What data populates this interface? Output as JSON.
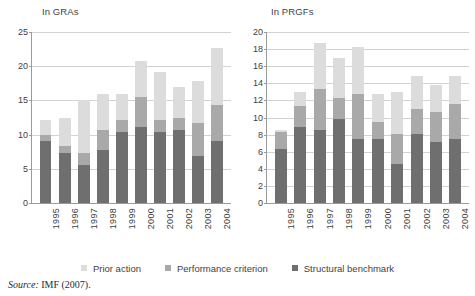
{
  "figure": {
    "source_label": "Source:",
    "source_text": "IMF (2007)."
  },
  "legend": {
    "items": [
      {
        "label": "Prior action",
        "color": "#dcdcdc",
        "key": "prior_action"
      },
      {
        "label": "Performance criterion",
        "color": "#a9a9a9",
        "key": "performance_criterion"
      },
      {
        "label": "Structural benchmark",
        "color": "#6f6f6f",
        "key": "structural_benchmark"
      }
    ]
  },
  "chart_data": [
    {
      "type": "bar",
      "id": "gra",
      "title": "In GRAs",
      "stacked": true,
      "xlabel": "",
      "ylabel": "",
      "ylim": [
        0,
        25
      ],
      "yticks": [
        0,
        5,
        10,
        15,
        20,
        25
      ],
      "grid": true,
      "legend_position": "bottom",
      "categories": [
        "1995",
        "1996",
        "1997",
        "1998",
        "1999",
        "2000",
        "2001",
        "2002",
        "2003",
        "2004"
      ],
      "series": [
        {
          "name": "Structural benchmark",
          "color": "#6f6f6f",
          "values": [
            9.1,
            7.3,
            5.6,
            7.8,
            10.4,
            11.1,
            10.4,
            10.7,
            6.9,
            9.1
          ]
        },
        {
          "name": "Performance criterion",
          "color": "#a9a9a9",
          "values": [
            0.8,
            1.0,
            1.7,
            2.9,
            1.7,
            4.4,
            1.7,
            1.8,
            4.8,
            5.2
          ]
        },
        {
          "name": "Prior action",
          "color": "#dcdcdc",
          "values": [
            2.2,
            4.2,
            7.8,
            5.3,
            3.9,
            5.3,
            7.1,
            4.4,
            6.1,
            8.3
          ]
        }
      ],
      "totals": [
        12.1,
        12.5,
        15.1,
        16.0,
        16.0,
        20.8,
        19.2,
        16.9,
        17.8,
        22.6
      ]
    },
    {
      "type": "bar",
      "id": "prgf",
      "title": "In PRGFs",
      "stacked": true,
      "xlabel": "",
      "ylabel": "",
      "ylim": [
        0,
        20
      ],
      "yticks": [
        0,
        2,
        4,
        6,
        8,
        10,
        12,
        14,
        16,
        18,
        20
      ],
      "grid": true,
      "legend_position": "bottom",
      "categories": [
        "1995",
        "1996",
        "1997",
        "1998",
        "1999",
        "2000",
        "2001",
        "2002",
        "2003",
        "2004"
      ],
      "series": [
        {
          "name": "Structural benchmark",
          "color": "#6f6f6f",
          "values": [
            6.3,
            8.9,
            8.5,
            9.8,
            7.5,
            7.5,
            4.6,
            8.1,
            7.1,
            7.5
          ]
        },
        {
          "name": "Performance criterion",
          "color": "#a9a9a9",
          "values": [
            2.0,
            2.4,
            4.8,
            2.5,
            5.2,
            2.0,
            3.5,
            2.9,
            3.5,
            4.1
          ]
        },
        {
          "name": "Prior action",
          "color": "#dcdcdc",
          "values": [
            0.2,
            1.7,
            5.4,
            4.7,
            5.6,
            3.3,
            4.9,
            3.8,
            3.2,
            3.2
          ]
        }
      ],
      "totals": [
        8.5,
        13.0,
        18.7,
        17.0,
        18.3,
        12.8,
        13.0,
        14.8,
        13.8,
        14.8
      ]
    }
  ]
}
